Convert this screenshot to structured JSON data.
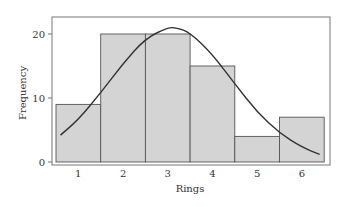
{
  "chart_data": {
    "type": "bar",
    "subtype": "histogram with fitted normal curve",
    "title": "",
    "xlabel": "Rings",
    "ylabel": "Frequency",
    "categories": [
      "1",
      "2",
      "3",
      "4",
      "5",
      "6"
    ],
    "values": [
      9,
      20,
      20,
      15,
      4,
      7
    ],
    "ylim": [
      0,
      22.5
    ],
    "yticks": [
      0,
      10,
      20
    ],
    "grid": false,
    "legend": null,
    "overlay": {
      "type": "line",
      "name": "normal fit",
      "x": [
        0.6,
        1.0,
        1.5,
        2.0,
        2.5,
        3.0,
        3.2,
        3.5,
        4.0,
        4.5,
        5.0,
        5.5,
        6.0,
        6.4
      ],
      "y": [
        4.2,
        6.6,
        10.8,
        15.4,
        19.3,
        21.0,
        21.0,
        20.2,
        16.8,
        12.2,
        7.8,
        4.5,
        2.3,
        1.2
      ]
    },
    "colors": {
      "bar_fill": "#d4d4d4",
      "bar_edge": "#555555",
      "curve": "#333333",
      "frame": "#777777"
    }
  },
  "axes": {
    "x_title": "Rings",
    "y_title": "Frequency",
    "x_ticks": [
      "1",
      "2",
      "3",
      "4",
      "5",
      "6"
    ],
    "y_ticks": [
      "0",
      "10",
      "20"
    ]
  }
}
